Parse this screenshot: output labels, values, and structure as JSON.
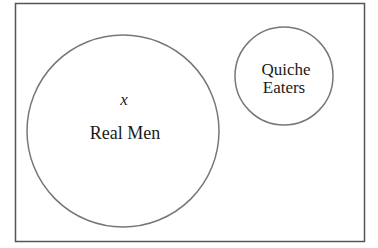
{
  "diagram": {
    "type": "venn",
    "universe": {
      "x": 15.5,
      "y": 3.5,
      "width": 349,
      "height": 238,
      "stroke": "#555555"
    },
    "sets": [
      {
        "name": "Real Men",
        "label": "Real Men",
        "cx": 123,
        "cy": 131,
        "r": 96,
        "stroke": "#777777"
      },
      {
        "name": "Quiche Eaters",
        "label_lines": [
          "Quiche",
          "Eaters"
        ],
        "cx": 284,
        "cy": 76,
        "r": 49,
        "stroke": "#777777"
      }
    ],
    "elements": [
      {
        "label": "x",
        "in_set": "Real Men"
      }
    ]
  }
}
